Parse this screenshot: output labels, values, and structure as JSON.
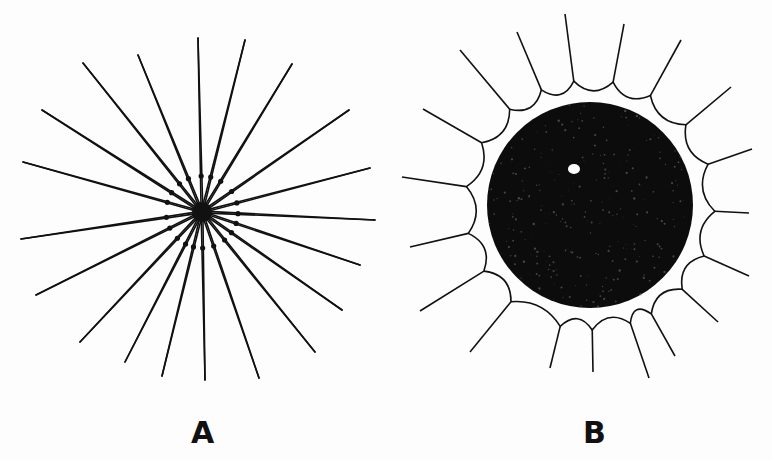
{
  "figure": {
    "panels": [
      {
        "label": "A",
        "description": "Radiating spines converging on a small dark central body",
        "center": [
          202,
          212
        ],
        "spine_count": 18,
        "spine_tips": [
          [
            198,
            38
          ],
          [
            245,
            40
          ],
          [
            292,
            64
          ],
          [
            349,
            110
          ],
          [
            370,
            168
          ],
          [
            375,
            220
          ],
          [
            360,
            265
          ],
          [
            342,
            310
          ],
          [
            315,
            352
          ],
          [
            259,
            378
          ],
          [
            205,
            380
          ],
          [
            162,
            376
          ],
          [
            125,
            362
          ],
          [
            80,
            342
          ],
          [
            36,
            295
          ],
          [
            21,
            239
          ],
          [
            23,
            162
          ],
          [
            42,
            110
          ],
          [
            83,
            63
          ],
          [
            138,
            55
          ]
        ]
      },
      {
        "label": "B",
        "description": "Dense dark spherical body with a small pale spot, surrounded by spines joined by curved membranes",
        "center": [
          590,
          205
        ],
        "body_radius": 103,
        "spine_tips": [
          [
            565,
            14
          ],
          [
            624,
            24
          ],
          [
            681,
            40
          ],
          [
            731,
            87
          ],
          [
            752,
            149
          ],
          [
            749,
            213
          ],
          [
            749,
            276
          ],
          [
            718,
            322
          ],
          [
            675,
            356
          ],
          [
            649,
            378
          ],
          [
            593,
            372
          ],
          [
            550,
            368
          ],
          [
            470,
            352
          ],
          [
            420,
            311
          ],
          [
            410,
            247
          ],
          [
            402,
            177
          ],
          [
            423,
            109
          ],
          [
            460,
            50
          ],
          [
            517,
            32
          ]
        ]
      }
    ]
  }
}
